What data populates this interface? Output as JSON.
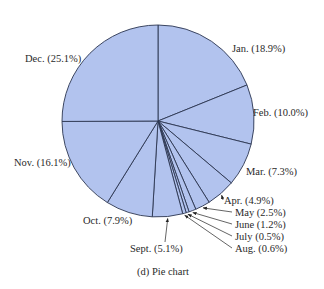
{
  "chart_data": {
    "type": "pie",
    "title": "",
    "caption": "(d) Pie chart",
    "start": "top",
    "direction": "clockwise",
    "fill_color": "#b2c3ee",
    "stroke_color": "#2b3550",
    "slices": [
      {
        "label": "Jan.",
        "value": 18.9,
        "text": "Jan. (18.9%)"
      },
      {
        "label": "Feb.",
        "value": 10.0,
        "text": "Feb. (10.0%)"
      },
      {
        "label": "Mar.",
        "value": 7.3,
        "text": "Mar. (7.3%)"
      },
      {
        "label": "Apr.",
        "value": 4.9,
        "text": "Apr. (4.9%)"
      },
      {
        "label": "May",
        "value": 2.5,
        "text": "May (2.5%)"
      },
      {
        "label": "June",
        "value": 1.2,
        "text": "June (1.2%)"
      },
      {
        "label": "July",
        "value": 0.5,
        "text": "July (0.5%)"
      },
      {
        "label": "Aug.",
        "value": 0.6,
        "text": "Aug. (0.6%)"
      },
      {
        "label": "Sept.",
        "value": 5.1,
        "text": "Sept. (5.1%)"
      },
      {
        "label": "Oct.",
        "value": 7.9,
        "text": "Oct. (7.9%)"
      },
      {
        "label": "Nov.",
        "value": 16.1,
        "text": "Nov. (16.1%)"
      },
      {
        "label": "Dec.",
        "value": 25.1,
        "text": "Dec. (25.1%)"
      }
    ]
  }
}
